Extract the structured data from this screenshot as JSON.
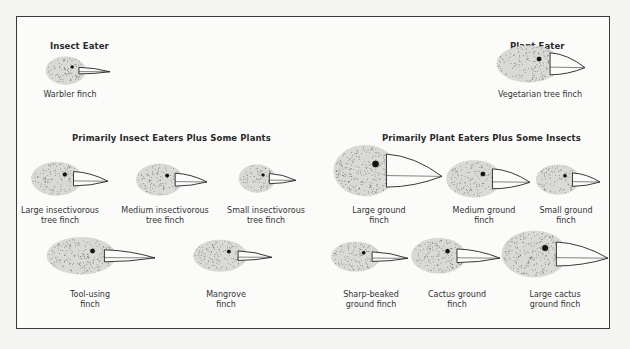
{
  "figure": {
    "categories": [
      {
        "id": "insect",
        "title": "Insect Eater"
      },
      {
        "id": "plant",
        "title": "Plant Eater"
      },
      {
        "id": "insect_plus",
        "title": "Primarily Insect Eaters Plus Some Plants"
      },
      {
        "id": "plant_plus",
        "title": "Primarily Plant Eaters Plus Some Insects"
      }
    ],
    "finches": [
      {
        "id": "warbler",
        "category": "insect",
        "lines": [
          "Warbler finch"
        ]
      },
      {
        "id": "vegetarian",
        "category": "plant",
        "lines": [
          "Vegetarian tree finch"
        ]
      },
      {
        "id": "large-insectivorous",
        "category": "insect_plus",
        "lines": [
          "Large insectivorous",
          "tree finch"
        ]
      },
      {
        "id": "medium-insectivorous",
        "category": "insect_plus",
        "lines": [
          "Medium insectivorous",
          "tree finch"
        ]
      },
      {
        "id": "small-insectivorous",
        "category": "insect_plus",
        "lines": [
          "Small insectivorous",
          "tree finch"
        ]
      },
      {
        "id": "tool-using",
        "category": "insect_plus",
        "lines": [
          "Tool-using",
          "finch"
        ]
      },
      {
        "id": "mangrove",
        "category": "insect_plus",
        "lines": [
          "Mangrove",
          "finch"
        ]
      },
      {
        "id": "large-ground",
        "category": "plant_plus",
        "lines": [
          "Large ground",
          "finch"
        ]
      },
      {
        "id": "medium-ground",
        "category": "plant_plus",
        "lines": [
          "Medium ground",
          "finch"
        ]
      },
      {
        "id": "small-ground",
        "category": "plant_plus",
        "lines": [
          "Small ground",
          "finch"
        ]
      },
      {
        "id": "sharp-beaked",
        "category": "plant_plus",
        "lines": [
          "Sharp-beaked",
          "ground finch"
        ]
      },
      {
        "id": "cactus-ground",
        "category": "plant_plus",
        "lines": [
          "Cactus ground",
          "finch"
        ]
      },
      {
        "id": "large-cactus",
        "category": "plant_plus",
        "lines": [
          "Large cactus",
          "ground finch"
        ]
      }
    ]
  }
}
